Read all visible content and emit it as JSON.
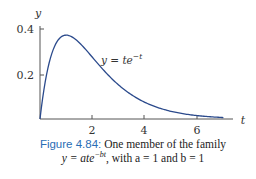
{
  "chart_data": {
    "type": "line",
    "title": "",
    "xlabel": "t",
    "ylabel": "y",
    "xlim": [
      0,
      7.5
    ],
    "ylim": [
      0,
      0.42
    ],
    "x_ticks": [
      2,
      4,
      6
    ],
    "y_ticks": [
      0.2,
      0.4
    ],
    "x_tick_labels": [
      "2",
      "4",
      "6"
    ],
    "y_tick_labels": [
      "0.2",
      "0.4"
    ],
    "grid": false,
    "series": [
      {
        "name": "y = te^{-t}",
        "function": "t*exp(-t)",
        "x": [
          0,
          0.25,
          0.5,
          0.75,
          1,
          1.5,
          2,
          2.5,
          3,
          3.5,
          4,
          4.5,
          5,
          5.5,
          6,
          6.5,
          7
        ],
        "values": [
          0,
          0.195,
          0.303,
          0.354,
          0.368,
          0.335,
          0.271,
          0.205,
          0.149,
          0.106,
          0.073,
          0.05,
          0.034,
          0.022,
          0.015,
          0.01,
          0.006
        ],
        "color": "#2b4a8c"
      }
    ],
    "annotations": [
      {
        "text": "y = te^{-t}",
        "x": 3.4,
        "y": 0.29
      }
    ]
  },
  "labels": {
    "y_axis": "y",
    "x_axis": "t",
    "y_tick_04": "0.4",
    "y_tick_02": "0.2",
    "x_tick_2": "2",
    "x_tick_4": "4",
    "x_tick_6": "6",
    "curve_label_prefix": "y = te",
    "curve_label_exp": "−t"
  },
  "caption": {
    "figure_label": "Figure 4.84:",
    "line1_text": " One member of the family",
    "line2_prefix": "y = ate",
    "line2_exp": "−bt",
    "line2_suffix": ", with a = 1 and b = 1"
  }
}
